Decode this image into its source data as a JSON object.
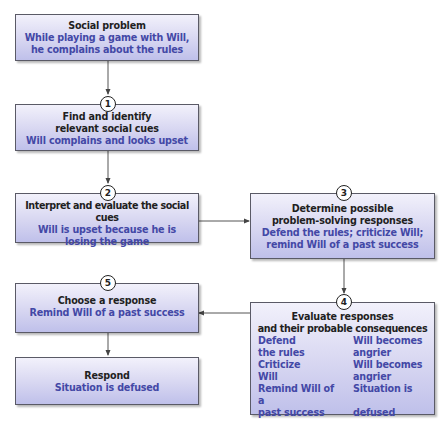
{
  "diagram": {
    "colors": {
      "title_text": "#1f1f1f",
      "example_text": "#4348a6",
      "box_border": "#5a5a66",
      "box_fill_top": "#f2f1fb",
      "box_fill_bottom": "#bfc0ea",
      "connector": "#555555"
    },
    "problem": {
      "title": "Social problem",
      "line1": "While playing a game with Will,",
      "line2": "he complains about the rules"
    },
    "steps": [
      {
        "number": "1",
        "title_line1": "Find and identify",
        "title_line2": "relevant social cues",
        "desc_line1": "Will complains and looks upset"
      },
      {
        "number": "2",
        "title_line1": "Interpret and evaluate the social cues",
        "desc_line1": "Will is upset because he is",
        "desc_line2": "losing the game"
      },
      {
        "number": "3",
        "title_line1": "Determine possible",
        "title_line2": "problem-solving responses",
        "desc_line1": "Defend the rules; criticize Will;",
        "desc_line2": "remind Will of a past success"
      },
      {
        "number": "4",
        "title_line1": "Evaluate responses",
        "title_line2": "and their probable consequences",
        "pairs": [
          {
            "response_line1": "Defend",
            "response_line2": "the rules",
            "consequence_line1": "Will becomes",
            "consequence_line2": "angrier"
          },
          {
            "response_line1": "Criticize",
            "response_line2": "Will",
            "consequence_line1": "Will becomes",
            "consequence_line2": "angrier"
          },
          {
            "response_line1": "Remind Will of a",
            "response_line2": "past success",
            "consequence_line1": "Situation is",
            "consequence_line2": "defused"
          }
        ]
      },
      {
        "number": "5",
        "title_line1": "Choose a response",
        "desc_line1": "Remind Will of a past success"
      }
    ],
    "respond": {
      "title": "Respond",
      "desc": "Situation is defused"
    },
    "edges": [
      {
        "from": "problem",
        "to": "step1"
      },
      {
        "from": "step1",
        "to": "step2"
      },
      {
        "from": "step2",
        "to": "step3"
      },
      {
        "from": "step3",
        "to": "step4"
      },
      {
        "from": "step4",
        "to": "step5"
      },
      {
        "from": "step5",
        "to": "respond"
      }
    ]
  }
}
